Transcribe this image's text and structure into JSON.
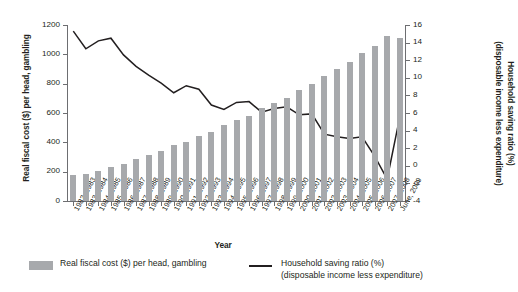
{
  "axes": {
    "left_title": "Real fiscal cost ($) per head, gambling",
    "right_title_line1": "Household saving ratio (%)",
    "right_title_line2": "(disposable income less expenditure)",
    "x_title": "Year"
  },
  "legend": {
    "bar_label": "Real fiscal cost ($) per head, gambling",
    "line_label_line1": "Household saving ratio (%)",
    "line_label_line2": "(disposable income less expenditure)"
  },
  "colors": {
    "bar": "#a7a9ac",
    "line": "#231f20",
    "axis": "#6d6e71",
    "text": "#231f20",
    "background": "#ffffff"
  },
  "chart_data": {
    "type": "bar",
    "title": "",
    "xlabel": "Year",
    "ylabel": "Real fiscal cost ($) per head, gambling",
    "y2label": "Household saving ratio (%) (disposable income less expenditure)",
    "ylim": [
      0,
      1200
    ],
    "y2lim": [
      -4,
      16
    ],
    "yticks": [
      0,
      200,
      400,
      600,
      800,
      1000,
      1200
    ],
    "y2ticks": [
      -4,
      -2,
      0,
      2,
      4,
      6,
      8,
      10,
      12,
      14,
      16
    ],
    "grid": false,
    "legend_position": "bottom",
    "categories": [
      "1982–1983",
      "1983–1984",
      "1984–1985",
      "1985–1986",
      "1986–1987",
      "1987–1988",
      "1988–1989",
      "1989–1990",
      "1990–1991",
      "1991–1992",
      "1992–1993",
      "1993–1994",
      "1994–1995",
      "1995–1996",
      "1996–1997",
      "1997–1998",
      "1998–1999",
      "1999–2000",
      "2000–2001",
      "2001–2002",
      "2002–2003",
      "2003–2004",
      "2004–2005",
      "2005–2006",
      "2006–2007",
      "2007–2008",
      "June, 2009"
    ],
    "series": [
      {
        "name": "Real fiscal cost ($) per head, gambling",
        "type": "bar",
        "axis": "left",
        "values": [
          175,
          185,
          205,
          230,
          250,
          285,
          315,
          340,
          380,
          405,
          440,
          470,
          520,
          555,
          580,
          635,
          670,
          700,
          760,
          800,
          855,
          900,
          950,
          1010,
          1060,
          1125,
          1110
        ]
      },
      {
        "name": "Household saving ratio (%)",
        "type": "line",
        "axis": "right",
        "values": [
          15.3,
          13.3,
          14.2,
          14.5,
          12.6,
          11.3,
          10.3,
          9.4,
          8.3,
          9.1,
          8.7,
          6.9,
          6.4,
          7.2,
          7.3,
          6.1,
          6.5,
          6.7,
          5.8,
          5.9,
          3.6,
          3.3,
          3.1,
          3.3,
          1.1,
          -1.5,
          5.5
        ]
      }
    ]
  }
}
